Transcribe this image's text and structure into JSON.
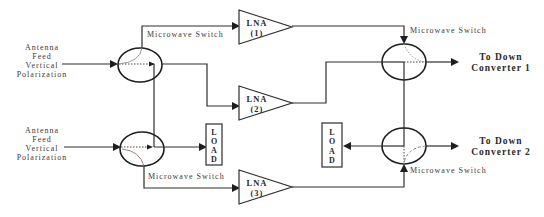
{
  "diagram": {
    "inputs": [
      {
        "lines": [
          "Antenna",
          "Feed",
          "Vertical",
          "Polarization"
        ]
      },
      {
        "lines": [
          "Antenna",
          "Feed",
          "Vertical",
          "Polarization"
        ]
      }
    ],
    "switches": [
      {
        "label": "Microwave Switch"
      },
      {
        "label": "Microwave Switch"
      },
      {
        "label": "Microwave Switch"
      },
      {
        "label": "Microwave Switch"
      }
    ],
    "amplifiers": [
      {
        "name": "LNA",
        "index": "(1)"
      },
      {
        "name": "LNA",
        "index": "(2)"
      },
      {
        "name": "LNA",
        "index": "(3)"
      }
    ],
    "loads": [
      {
        "letters": [
          "L",
          "O",
          "A",
          "D"
        ]
      },
      {
        "letters": [
          "L",
          "O",
          "A",
          "D"
        ]
      }
    ],
    "outputs": [
      {
        "lines": [
          "To Down",
          "Converter 1"
        ]
      },
      {
        "lines": [
          "To Down",
          "Converter 2"
        ]
      }
    ]
  },
  "colors": {
    "background": "#ffffff",
    "line": "#2e2e2e",
    "text": "#3a3a3a"
  }
}
